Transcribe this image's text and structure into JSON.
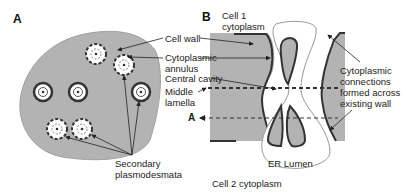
{
  "panels": {
    "a": {
      "letter": "A"
    },
    "b": {
      "letter": "B"
    }
  },
  "labels": {
    "cell_wall": "Cell wall",
    "cytoplasmic_annulus_1": "Cytoplasmic",
    "cytoplasmic_annulus_2": "annulus",
    "central_cavity": "Central cavity",
    "middle_lamella_1": "Middle",
    "middle_lamella_2": "lamella",
    "section_a": "A",
    "secondary_1": "Secondary",
    "secondary_2": "plasmodesmata",
    "cell1_1": "Cell 1",
    "cell1_2": "cytoplasm",
    "connections_1": "Cytoplasmic",
    "connections_2": "connections",
    "connections_3": "formed across",
    "connections_4": "existing wall",
    "er_lumen": "ER Lumen",
    "cell2": "Cell 2 cytoplasm"
  },
  "colors": {
    "wall_fill": "#b3b3b3",
    "outline": "#3a3a3a",
    "background": "#ffffff"
  }
}
